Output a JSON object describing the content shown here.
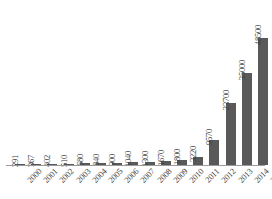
{
  "chart_data": {
    "type": "bar",
    "title": "",
    "subtitle": "",
    "xlabel": "",
    "ylabel": "",
    "categories": [
      "2000",
      "2001",
      "2002",
      "2003",
      "2004",
      "2005",
      "2006",
      "2007",
      "2008",
      "2009",
      "2010",
      "2011",
      "2012",
      "2013",
      "2014",
      "2015"
    ],
    "values": [
      291,
      367,
      402,
      510,
      680,
      840,
      900,
      1040,
      1300,
      1670,
      1800,
      3220,
      9570,
      23700,
      35000,
      48500
    ],
    "data_labels": [
      "291",
      "367",
      "402",
      "510",
      "680",
      "840",
      "900",
      "1040",
      "1300",
      "1670",
      "1800",
      "3220",
      "9570",
      "23700",
      "35000",
      "48500"
    ],
    "series": [
      {
        "name": "",
        "values": [
          291,
          367,
          402,
          510,
          680,
          840,
          900,
          1040,
          1300,
          1670,
          1800,
          3220,
          9570,
          23700,
          35000,
          48500
        ]
      }
    ],
    "ylim": [
      0,
      48500
    ],
    "grid": false,
    "legend": false,
    "legend_position": "none",
    "axis_visible": {
      "x": true,
      "y": false
    },
    "data_labels_rotation": 90,
    "tick_labels_rotation": 45,
    "colors": {
      "bar": "#595959",
      "axis": "#9a9a9a",
      "text": "#3b3b3b",
      "background": "#ffffff"
    }
  }
}
